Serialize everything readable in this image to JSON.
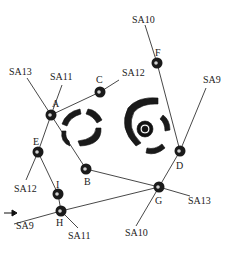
{
  "diagram": {
    "type": "belt/pulley schematic",
    "nodes": [
      {
        "id": "A",
        "label": "A",
        "x": 51,
        "y": 115
      },
      {
        "id": "B",
        "label": "B",
        "x": 86,
        "y": 169
      },
      {
        "id": "C",
        "label": "C",
        "x": 100,
        "y": 92
      },
      {
        "id": "D",
        "label": "D",
        "x": 180,
        "y": 151
      },
      {
        "id": "E",
        "label": "E",
        "x": 38,
        "y": 152
      },
      {
        "id": "F",
        "label": "F",
        "x": 157,
        "y": 63
      },
      {
        "id": "G",
        "label": "G",
        "x": 159,
        "y": 187
      },
      {
        "id": "H",
        "label": "H",
        "x": 61,
        "y": 211
      },
      {
        "id": "I",
        "label": "I",
        "x": 58,
        "y": 194
      }
    ],
    "labels": [
      {
        "text": "SA13",
        "x": 9,
        "y": 67
      },
      {
        "text": "SA11",
        "x": 50,
        "y": 72
      },
      {
        "text": "C",
        "x": 96,
        "y": 75
      },
      {
        "text": "SA12",
        "x": 122,
        "y": 68
      },
      {
        "text": "SA10",
        "x": 132,
        "y": 15
      },
      {
        "text": "F",
        "x": 155,
        "y": 48
      },
      {
        "text": "SA9",
        "x": 203,
        "y": 75
      },
      {
        "text": "A",
        "x": 52,
        "y": 99
      },
      {
        "text": "E",
        "x": 33,
        "y": 137
      },
      {
        "text": "B",
        "x": 85,
        "y": 178
      },
      {
        "text": "D",
        "x": 176,
        "y": 161
      },
      {
        "text": "SA12",
        "x": 14,
        "y": 184
      },
      {
        "text": "I",
        "x": 55,
        "y": 180
      },
      {
        "text": "G",
        "x": 155,
        "y": 196
      },
      {
        "text": "SA13",
        "x": 188,
        "y": 196
      },
      {
        "text": "SA9",
        "x": 16,
        "y": 221
      },
      {
        "text": "H",
        "x": 56,
        "y": 218
      },
      {
        "text": "SA11",
        "x": 68,
        "y": 231
      },
      {
        "text": "SA10",
        "x": 125,
        "y": 228
      }
    ],
    "arrow": {
      "direction": "right",
      "x": 6,
      "y": 213
    }
  }
}
